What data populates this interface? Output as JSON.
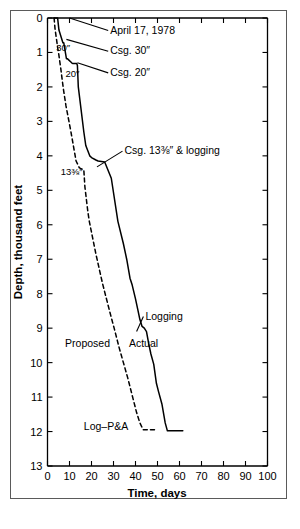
{
  "figure": {
    "background_color": "#ffffff",
    "frame_color": "#5a5a5a",
    "line_color": "#000000"
  },
  "chart_data": {
    "type": "line",
    "title": "",
    "subtitle": "",
    "xlabel": "Time, days",
    "ylabel": "Depth, thousand feet",
    "xlim": [
      0,
      100
    ],
    "ylim": [
      13,
      0
    ],
    "y_inverted": true,
    "grid": false,
    "legend_position": "inline-annotations",
    "xticks": [
      0,
      10,
      20,
      30,
      40,
      50,
      60,
      70,
      80,
      90,
      100
    ],
    "xtick_labels": [
      "0",
      "10",
      "20",
      "30",
      "40",
      "50",
      "60",
      "70",
      "80",
      "90",
      "100"
    ],
    "yticks": [
      0,
      1,
      2,
      3,
      4,
      5,
      6,
      7,
      8,
      9,
      10,
      11,
      12,
      13
    ],
    "ytick_labels": [
      "0",
      "1",
      "2",
      "3",
      "4",
      "5",
      "6",
      "7",
      "8",
      "9",
      "10",
      "11",
      "12",
      "13"
    ],
    "series": [
      {
        "name": "Actual",
        "style": "solid",
        "color": "#000000",
        "x": [
          3.0,
          4.6,
          5.2,
          7.0,
          7.4,
          8.6,
          9.0,
          11.0,
          11.4,
          13.3,
          13.6,
          14.0,
          16.5,
          17.4,
          19.2,
          20.0,
          22.0,
          23.0,
          26.0,
          29.0,
          32.0,
          34.5,
          36.0,
          37.5,
          38.5,
          40.0,
          41.0,
          42.0,
          43.0,
          44.0,
          45.0,
          46.0,
          47.0,
          48.3,
          49.5,
          50.5,
          52.0,
          53.5,
          54.5,
          61.5
        ],
        "y": [
          0.0,
          0.0,
          0.35,
          0.72,
          0.72,
          1.18,
          1.18,
          1.3,
          1.32,
          1.32,
          1.38,
          2.0,
          3.3,
          3.7,
          4.0,
          4.05,
          4.12,
          4.15,
          4.18,
          4.65,
          5.9,
          6.55,
          7.0,
          7.55,
          7.75,
          8.15,
          8.45,
          8.75,
          8.95,
          9.0,
          9.1,
          9.45,
          9.75,
          10.05,
          10.6,
          10.85,
          11.2,
          11.75,
          11.98,
          11.98
        ]
      },
      {
        "name": "Proposed",
        "style": "dashed",
        "color": "#000000",
        "x": [
          3.0,
          3.4,
          4.6,
          5.0,
          6.0,
          7.2,
          8.4,
          10.5,
          13.0,
          14.5,
          15.5,
          16.5,
          17.0,
          18.3,
          19.0,
          22.0,
          25.0,
          28.0,
          30.5,
          32.5,
          34.5,
          36.5,
          38.5,
          40.5,
          42.0,
          43.5,
          50.0
        ],
        "y": [
          0.0,
          0.3,
          0.85,
          1.0,
          1.45,
          2.05,
          2.55,
          3.25,
          4.15,
          4.35,
          4.38,
          4.4,
          4.9,
          5.6,
          5.9,
          6.85,
          7.7,
          8.45,
          9.05,
          9.55,
          10.0,
          10.45,
          10.95,
          11.45,
          11.75,
          11.95,
          11.95
        ]
      }
    ],
    "annotations": [
      {
        "name": "april-date",
        "text": "April 17, 1978",
        "x": 28.5,
        "y": 0.45,
        "leader_to_x": 10.0,
        "leader_to_y": 0.0
      },
      {
        "name": "csg-30",
        "text": "Csg. 30″",
        "x": 28.5,
        "y": 1.05,
        "leader_to_x": 8.6,
        "leader_to_y": 0.62
      },
      {
        "name": "csg-20",
        "text": "Csg. 20″",
        "x": 28.5,
        "y": 1.68,
        "leader_to_x": 13.6,
        "leader_to_y": 1.3
      },
      {
        "name": "csg-13-3-8-logging",
        "text": "Csg. 13⅜″ & logging",
        "x": 35.0,
        "y": 3.95,
        "leader_to_x": 22.5,
        "leader_to_y": 4.32
      },
      {
        "name": "label-30-inch",
        "text": "30″",
        "x": 4.0,
        "y": 0.95
      },
      {
        "name": "label-20-inch",
        "text": "20″",
        "x": 8.2,
        "y": 1.72
      },
      {
        "name": "label-13-3-8-inch",
        "text": "13⅜″",
        "x": 6.0,
        "y": 4.55
      },
      {
        "name": "label-proposed",
        "text": "Proposed",
        "x": 8.0,
        "y": 9.55
      },
      {
        "name": "label-actual",
        "text": "Actual",
        "x": 37.0,
        "y": 9.55
      },
      {
        "name": "label-logging",
        "text": "Logging",
        "x": 44.5,
        "y": 8.75,
        "leader_to_x": 40.5,
        "leader_to_y": 9.1
      },
      {
        "name": "label-log-pa",
        "text": "Log–P&A",
        "x": 16.5,
        "y": 11.95
      }
    ]
  }
}
